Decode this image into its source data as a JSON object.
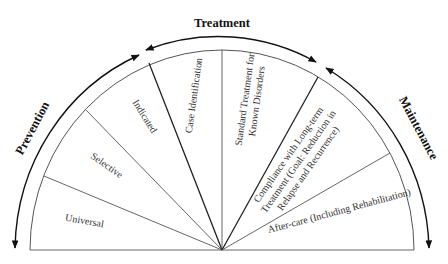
{
  "diagram": {
    "type": "semicircle-spectrum",
    "phases": {
      "prevention": "Prevention",
      "treatment": "Treatment",
      "maintenance": "Maintenance"
    },
    "segments": {
      "universal": "Universal",
      "selective": "Selective",
      "indicated": "Indicated",
      "case_identification": "Case Identification",
      "standard_treatment_line1": "Standard Treatment for",
      "standard_treatment_line2": "Known Disorders",
      "compliance_line1": "Compliance with Long-term",
      "compliance_line2": "Treatment (Goal: Reduction in",
      "compliance_line3": "Relapse and Recurrence)",
      "aftercare": "After-care (Including Rehabilitation)"
    },
    "colors": {
      "line": "#333333",
      "text": "#333333",
      "phase_text": "#111111"
    }
  }
}
